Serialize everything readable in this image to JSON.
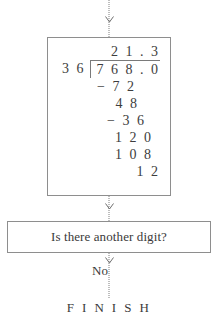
{
  "flowchart": {
    "title": "Long division flowchart step",
    "top_connector": {
      "icon": "down-arrow-icon",
      "style": "dotted"
    },
    "division_box": {
      "problem": "768.0 divided by 36",
      "quotient": "2 1 . 3",
      "divisor": "3 6",
      "dividend": "7 6 8 . 0",
      "steps": [
        {
          "label": "subtract-72",
          "text": "− 7 2"
        },
        {
          "label": "remainder-48",
          "text": "4 8"
        },
        {
          "label": "subtract-36",
          "text": "− 3 6"
        },
        {
          "label": "bring-down-120",
          "text": "1 2 0"
        },
        {
          "label": "subtract-108",
          "text": "1 0 8"
        },
        {
          "label": "remainder-12",
          "text": "1 2"
        }
      ]
    },
    "mid_connector": {
      "icon": "down-arrow-icon",
      "style": "dotted"
    },
    "decision_box": {
      "question": "Is there another digit?"
    },
    "bottom_connector": {
      "icon": "down-arrow-icon",
      "style": "dotted"
    },
    "branch_label": "No",
    "terminal_label": "F I N I S H"
  },
  "colors": {
    "border": "#8e8e8e",
    "text": "#3a3a3a",
    "connector": "#7c7c7c",
    "background": "#ffffff"
  }
}
